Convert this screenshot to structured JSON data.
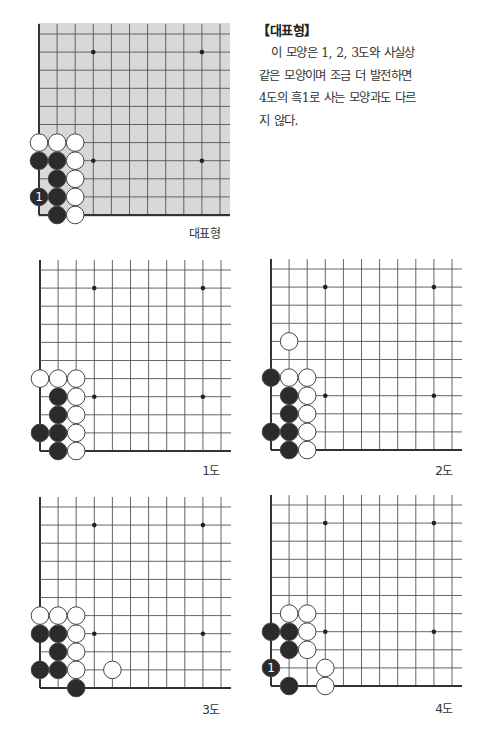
{
  "article": {
    "heading": "【대표형】",
    "lines": [
      "이 모양은 1, 2, 3도와 사실상",
      "같은 모양이며 조금 더 발전하면",
      "4도의 흑1로 사는 모양과도 다르",
      "지 않다."
    ]
  },
  "colors": {
    "grid_line": "#555555",
    "edge_line": "#333333",
    "shaded_board": "#d8d8d8",
    "black_stone": "#2b2b2b",
    "white_stone": "#ffffff",
    "stone_outline": "#444444"
  },
  "diagrams": [
    {
      "id": "representative",
      "caption": "대표형",
      "shaded": true,
      "stones": [
        {
          "c": 0,
          "r": 6,
          "color": "W"
        },
        {
          "c": 1,
          "r": 6,
          "color": "W"
        },
        {
          "c": 2,
          "r": 6,
          "color": "W"
        },
        {
          "c": 0,
          "r": 7,
          "color": "B"
        },
        {
          "c": 1,
          "r": 7,
          "color": "B"
        },
        {
          "c": 2,
          "r": 7,
          "color": "W"
        },
        {
          "c": 1,
          "r": 8,
          "color": "B"
        },
        {
          "c": 2,
          "r": 8,
          "color": "W"
        },
        {
          "c": 0,
          "r": 9,
          "color": "B",
          "label": "1"
        },
        {
          "c": 1,
          "r": 9,
          "color": "B"
        },
        {
          "c": 2,
          "r": 9,
          "color": "W"
        },
        {
          "c": 1,
          "r": 10,
          "color": "B"
        },
        {
          "c": 2,
          "r": 10,
          "color": "W"
        }
      ]
    },
    {
      "id": "diagram-1",
      "caption": "1도",
      "shaded": false,
      "stones": [
        {
          "c": 0,
          "r": 6,
          "color": "W"
        },
        {
          "c": 1,
          "r": 6,
          "color": "W"
        },
        {
          "c": 2,
          "r": 6,
          "color": "W"
        },
        {
          "c": 1,
          "r": 7,
          "color": "B"
        },
        {
          "c": 2,
          "r": 7,
          "color": "W"
        },
        {
          "c": 1,
          "r": 8,
          "color": "B"
        },
        {
          "c": 2,
          "r": 8,
          "color": "W"
        },
        {
          "c": 0,
          "r": 9,
          "color": "B"
        },
        {
          "c": 1,
          "r": 9,
          "color": "B"
        },
        {
          "c": 2,
          "r": 9,
          "color": "W"
        },
        {
          "c": 1,
          "r": 10,
          "color": "B"
        },
        {
          "c": 2,
          "r": 10,
          "color": "W"
        }
      ]
    },
    {
      "id": "diagram-2",
      "caption": "2도",
      "shaded": false,
      "stones": [
        {
          "c": 1,
          "r": 4,
          "color": "W"
        },
        {
          "c": 0,
          "r": 6,
          "color": "B"
        },
        {
          "c": 1,
          "r": 6,
          "color": "W"
        },
        {
          "c": 2,
          "r": 6,
          "color": "W"
        },
        {
          "c": 1,
          "r": 7,
          "color": "B"
        },
        {
          "c": 2,
          "r": 7,
          "color": "W"
        },
        {
          "c": 1,
          "r": 8,
          "color": "B"
        },
        {
          "c": 2,
          "r": 8,
          "color": "W"
        },
        {
          "c": 0,
          "r": 9,
          "color": "B"
        },
        {
          "c": 1,
          "r": 9,
          "color": "B"
        },
        {
          "c": 2,
          "r": 9,
          "color": "W"
        },
        {
          "c": 1,
          "r": 10,
          "color": "B"
        },
        {
          "c": 2,
          "r": 10,
          "color": "W"
        }
      ]
    },
    {
      "id": "diagram-3",
      "caption": "3도",
      "shaded": false,
      "stones": [
        {
          "c": 0,
          "r": 6,
          "color": "W"
        },
        {
          "c": 1,
          "r": 6,
          "color": "W"
        },
        {
          "c": 2,
          "r": 6,
          "color": "W"
        },
        {
          "c": 0,
          "r": 7,
          "color": "B"
        },
        {
          "c": 1,
          "r": 7,
          "color": "B"
        },
        {
          "c": 2,
          "r": 7,
          "color": "W"
        },
        {
          "c": 1,
          "r": 8,
          "color": "B"
        },
        {
          "c": 2,
          "r": 8,
          "color": "W"
        },
        {
          "c": 0,
          "r": 9,
          "color": "B"
        },
        {
          "c": 1,
          "r": 9,
          "color": "B"
        },
        {
          "c": 2,
          "r": 9,
          "color": "W"
        },
        {
          "c": 4,
          "r": 9,
          "color": "W"
        },
        {
          "c": 2,
          "r": 10,
          "color": "B"
        }
      ]
    },
    {
      "id": "diagram-4",
      "caption": "4도",
      "shaded": false,
      "stones": [
        {
          "c": 1,
          "r": 6,
          "color": "W"
        },
        {
          "c": 2,
          "r": 6,
          "color": "W"
        },
        {
          "c": 0,
          "r": 7,
          "color": "B"
        },
        {
          "c": 1,
          "r": 7,
          "color": "B"
        },
        {
          "c": 2,
          "r": 7,
          "color": "W"
        },
        {
          "c": 1,
          "r": 8,
          "color": "B"
        },
        {
          "c": 2,
          "r": 8,
          "color": "W"
        },
        {
          "c": 0,
          "r": 9,
          "color": "B",
          "label": "1"
        },
        {
          "c": 3,
          "r": 9,
          "color": "W"
        },
        {
          "c": 1,
          "r": 10,
          "color": "B"
        },
        {
          "c": 3,
          "r": 10,
          "color": "W"
        }
      ]
    }
  ],
  "star_points": [
    {
      "c": 3,
      "r": 1
    },
    {
      "c": 9,
      "r": 1
    },
    {
      "c": 3,
      "r": 7
    },
    {
      "c": 9,
      "r": 7
    }
  ]
}
